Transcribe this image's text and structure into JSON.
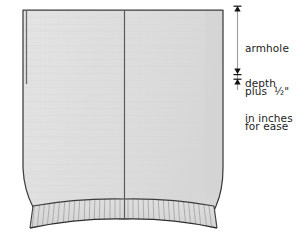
{
  "diagram": {
    "colors": {
      "fabric_fill": "#dcdcdc",
      "fabric_fill_light": "#e3e3e3",
      "outline": "#3a3a3a",
      "seam_line": "#555555",
      "rib_stripe": "#9a9a9a",
      "text": "#1c1c1c",
      "measure_line": "#8a8a8a",
      "arrow": "#111111",
      "background": "#ffffff"
    }
  },
  "annotations": {
    "armhole": {
      "line1": "armhole",
      "line2": "depth",
      "line3": "in inches"
    },
    "ease": {
      "line1": "plus  ½\"",
      "line2": "for ease"
    }
  },
  "markers": {
    "top_arrow": "arrow-up",
    "mid_arrow_down": "arrow-down",
    "mid_arrow_up": "arrow-up"
  }
}
